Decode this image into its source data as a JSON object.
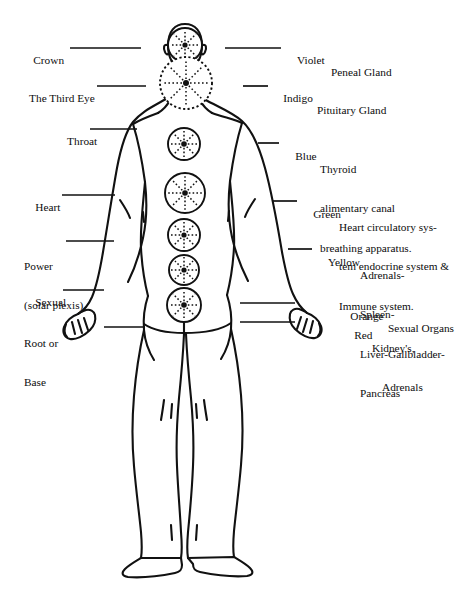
{
  "diagram": {
    "view": "back",
    "stroke_color": "#111111",
    "background": "#ffffff"
  },
  "left_labels": [
    {
      "id": "crown",
      "text": "Crown",
      "sub": ""
    },
    {
      "id": "third-eye",
      "text": "The Third Eye",
      "sub": ""
    },
    {
      "id": "throat",
      "text": "Throat",
      "sub": ""
    },
    {
      "id": "heart",
      "text": "Heart",
      "sub": ""
    },
    {
      "id": "power",
      "text": "Power",
      "sub": "(solar plexis)"
    },
    {
      "id": "sexual",
      "text": "Sexual",
      "sub": ""
    },
    {
      "id": "root",
      "text": "Root or",
      "sub": "Base"
    }
  ],
  "right_labels": [
    {
      "id": "violet",
      "color_name": "Violet",
      "gland": [
        "Peneal Gland"
      ]
    },
    {
      "id": "indigo",
      "color_name": "Indigo",
      "gland": [
        "Pituitary Gland"
      ]
    },
    {
      "id": "blue",
      "color_name": "Blue",
      "gland": [
        "Thyroid",
        "alimentary canal",
        "breathing apparatus."
      ]
    },
    {
      "id": "green",
      "color_name": "Green",
      "gland": [
        "Heart circulatory sys-",
        "tem endocrine system &",
        "Immune system."
      ]
    },
    {
      "id": "yellow",
      "color_name": "Yellow",
      "gland": [
        "Adrenals-",
        "Spleen-",
        "Liver-Gallbladder-",
        "Pancreas"
      ]
    },
    {
      "id": "orange",
      "color_name": "Orange",
      "gland": [
        "Sexual Organs"
      ]
    },
    {
      "id": "red",
      "color_name": "Red",
      "gland": [
        "Kidney's,",
        "Adrenals"
      ]
    }
  ],
  "chakra_points": [
    {
      "id": "crown",
      "cx": 185,
      "cy": 45,
      "r": 17
    },
    {
      "id": "third-eye",
      "cx": 186,
      "cy": 83,
      "r": 26
    },
    {
      "id": "throat",
      "cx": 184,
      "cy": 144,
      "r": 16
    },
    {
      "id": "heart",
      "cx": 185,
      "cy": 193,
      "r": 20
    },
    {
      "id": "power",
      "cx": 184,
      "cy": 235,
      "r": 16
    },
    {
      "id": "sexual",
      "cx": 184,
      "cy": 270,
      "r": 15
    },
    {
      "id": "root",
      "cx": 184,
      "cy": 305,
      "r": 17
    }
  ]
}
